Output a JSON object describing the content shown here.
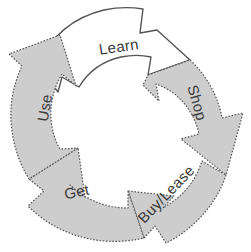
{
  "diagram": {
    "type": "cycle-diagram",
    "title": "",
    "direction": "clockwise",
    "colors": {
      "gray_fill": "#cdcdcd",
      "white_fill": "#ffffff",
      "outline": "#555555",
      "label_text": "#3a3a3a",
      "background": "#ffffff"
    },
    "segments": [
      {
        "id": "learn",
        "label": "Learn",
        "fill": "#ffffff",
        "stroke_style": "solid",
        "position": "top",
        "label_x": 119,
        "label_y": 48,
        "label_rotation": -8
      },
      {
        "id": "shop",
        "label": "Shop",
        "fill": "#cdcdcd",
        "stroke_style": "dashed",
        "position": "right",
        "label_x": 196,
        "label_y": 103,
        "label_rotation": 74
      },
      {
        "id": "buy-lease",
        "label": "Buy/Lease",
        "fill": "#cdcdcd",
        "stroke_style": "dashed",
        "position": "bottom-right",
        "label_x": 167,
        "label_y": 195,
        "label_rotation": -46
      },
      {
        "id": "get",
        "label": "Get",
        "fill": "#cdcdcd",
        "stroke_style": "dashed",
        "position": "bottom-left",
        "label_x": 77,
        "label_y": 193,
        "label_rotation": -12
      },
      {
        "id": "use",
        "label": "Use",
        "fill": "#cdcdcd",
        "stroke_style": "dashed",
        "position": "left",
        "label_x": 46,
        "label_y": 108,
        "label_rotation": -80
      }
    ]
  }
}
